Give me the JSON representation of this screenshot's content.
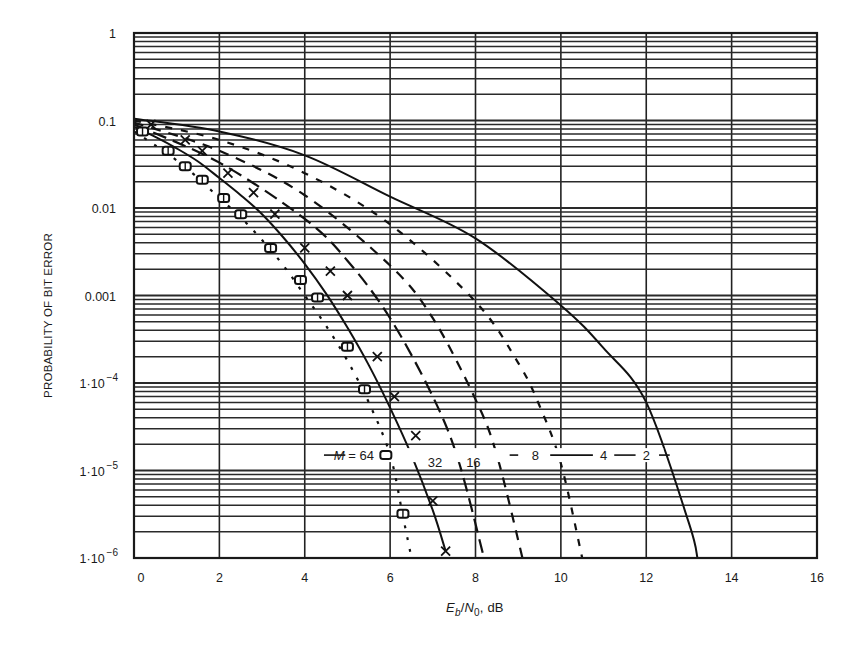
{
  "chart_data": {
    "type": "line",
    "title": "",
    "xlabel": "Eb/N0, dB",
    "xlabel_parts": {
      "E": "E",
      "b": "b",
      "slash": "/",
      "N": "N",
      "zero": "0",
      "unit": ", dB"
    },
    "ylabel": "PROBABILITY OF BIT ERROR",
    "xlim": [
      0,
      16
    ],
    "ylim": [
      1e-06,
      1
    ],
    "yscale": "log",
    "grid": true,
    "x_ticks": [
      "0",
      "2",
      "4",
      "6",
      "8",
      "10",
      "12",
      "14",
      "16"
    ],
    "y_ticks": [
      {
        "value": 1,
        "label": "1",
        "sup": ""
      },
      {
        "value": 0.1,
        "label": "0.1",
        "sup": ""
      },
      {
        "value": 0.01,
        "label": "0.01",
        "sup": ""
      },
      {
        "value": 0.001,
        "label": "0.001",
        "sup": ""
      },
      {
        "value": 0.0001,
        "label": "1·10",
        "sup": "−4"
      },
      {
        "value": 1e-05,
        "label": "1·10",
        "sup": "−5"
      },
      {
        "value": 1e-06,
        "label": "1·10",
        "sup": "−6"
      }
    ],
    "legend_position": "inline labels near 1.5e-5",
    "series": [
      {
        "name": "M = 2",
        "label": "2",
        "style": "solid",
        "marker": "none",
        "x": [
          0,
          2,
          4,
          6,
          8,
          10,
          11,
          12,
          13,
          13.2
        ],
        "y": [
          0.105,
          0.075,
          0.04,
          0.0135,
          0.0045,
          0.00077,
          0.00025,
          6e-05,
          2.5e-06,
          1e-06
        ]
      },
      {
        "name": "M = 4",
        "label": "4",
        "style": "dashed-fine",
        "marker": "none",
        "x": [
          0,
          2,
          4,
          6,
          8,
          9,
          9.5,
          10,
          10.5
        ],
        "y": [
          0.1,
          0.06,
          0.025,
          0.0065,
          0.00085,
          0.00017,
          5.5e-05,
          1.2e-05,
          1e-06
        ]
      },
      {
        "name": "M = 8",
        "label": "8",
        "style": "dashed",
        "marker": "none",
        "x": [
          0,
          2,
          4,
          6,
          7,
          8,
          8.5,
          9.1
        ],
        "y": [
          0.095,
          0.045,
          0.014,
          0.0022,
          0.00055,
          6.5e-05,
          1.5e-05,
          1e-06
        ]
      },
      {
        "name": "M = 16",
        "label": "16",
        "style": "long-dashed",
        "marker": "none",
        "x": [
          0,
          2,
          4,
          5,
          6,
          7,
          7.6,
          8.2
        ],
        "y": [
          0.09,
          0.033,
          0.0075,
          0.0025,
          0.00055,
          7e-05,
          1.3e-05,
          1e-06
        ]
      },
      {
        "name": "M = 32",
        "label": "32",
        "style": "solid",
        "marker": "x",
        "x": [
          0,
          0.5,
          1,
          1.5,
          2,
          2.5,
          3,
          3.5,
          4,
          4.5,
          5,
          5.5,
          6,
          6.5,
          7,
          7.3
        ],
        "y": [
          0.085,
          0.065,
          0.048,
          0.034,
          0.022,
          0.014,
          0.0085,
          0.0046,
          0.0023,
          0.00105,
          0.00043,
          0.00016,
          5.2e-05,
          1.5e-05,
          3.5e-06,
          1.2e-06
        ]
      },
      {
        "name": "M = 64",
        "label": "M = 64",
        "style": "dotted",
        "marker": "square",
        "x": [
          0,
          0.5,
          1,
          1.5,
          2,
          2.5,
          3,
          3.5,
          4,
          4.5,
          5,
          5.5,
          6,
          6.3,
          6.5
        ],
        "y": [
          0.075,
          0.052,
          0.035,
          0.022,
          0.013,
          0.0078,
          0.0043,
          0.0022,
          0.001,
          0.00045,
          0.00018,
          6e-05,
          1.5e-05,
          3e-06,
          1e-06
        ]
      }
    ],
    "markers_x": [
      {
        "series": "M = 32",
        "x": [
          0.4,
          1.2,
          1.6,
          2.2,
          2.8,
          3.3,
          4.0,
          4.6,
          5.0,
          5.7,
          6.1,
          6.6,
          7.0,
          7.3
        ],
        "y": [
          0.09,
          0.06,
          0.045,
          0.025,
          0.015,
          0.0085,
          0.0035,
          0.0019,
          0.001,
          0.0002,
          7e-05,
          2.5e-05,
          4.5e-06,
          1.2e-06
        ]
      },
      {
        "series": "M = 64",
        "x": [
          0.2,
          0.8,
          1.2,
          1.6,
          2.1,
          2.5,
          3.2,
          3.9,
          4.3,
          5.0,
          5.4,
          5.9,
          6.3
        ],
        "y": [
          0.075,
          0.045,
          0.03,
          0.021,
          0.013,
          0.0085,
          0.0035,
          0.0015,
          0.00095,
          0.00026,
          8.5e-05,
          1.5e-05,
          3.2e-06
        ]
      }
    ],
    "label_row_ber": 1.5e-05,
    "colors": {
      "ink": "#1a1a1a",
      "background": "#ffffff",
      "grid": "#2a2a2a"
    }
  },
  "layout": {
    "plot": {
      "left": 134,
      "top": 33,
      "right": 817,
      "bottom": 558
    },
    "labels_pos": {
      "m64": {
        "x": 5.15
      },
      "m32": {
        "x": 7.05
      },
      "m16": {
        "x": 7.95
      },
      "m8": {
        "x": 9.4
      },
      "m4": {
        "x": 11.0
      },
      "m2": {
        "x": 12.0
      }
    }
  }
}
